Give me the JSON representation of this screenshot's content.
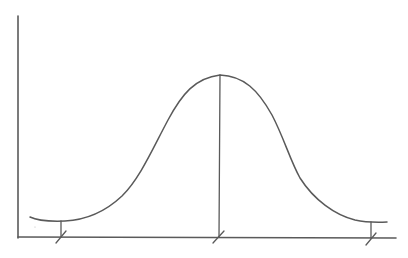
{
  "diagram": {
    "type": "hand-drawn normal distribution (bell curve) sketch",
    "colors": {
      "background": "#ffffff",
      "stroke": "#5a5a5a"
    },
    "axes": {
      "y_axis": {
        "x": 18,
        "y1": 16,
        "y2": 238
      },
      "x_axis": {
        "y": 237,
        "x1": 18,
        "x2": 396
      }
    },
    "curve": {
      "shape": "bell",
      "start": [
        30,
        217
      ],
      "peak": [
        220,
        75
      ],
      "end": [
        387,
        222
      ]
    },
    "markers": [
      {
        "name": "left-marker",
        "x": 61,
        "top": 221
      },
      {
        "name": "center-marker",
        "x": 220,
        "top": 75
      },
      {
        "name": "right-marker",
        "x": 371,
        "top": 222
      }
    ],
    "labels": []
  }
}
